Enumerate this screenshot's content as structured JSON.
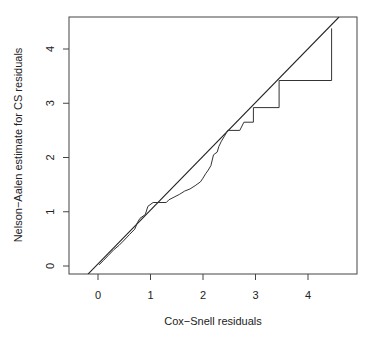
{
  "chart_data": {
    "type": "line",
    "title": "",
    "xlabel": "Cox−Snell residuals",
    "ylabel": "Nelson−Aalen estimate for CS residuals",
    "xlim": [
      -0.55,
      4.95
    ],
    "ylim": [
      -0.15,
      4.59
    ],
    "xticks": [
      0,
      1,
      2,
      3,
      4
    ],
    "yticks": [
      0,
      1,
      2,
      3,
      4
    ],
    "grid": false,
    "legend": null,
    "series": [
      {
        "name": "Nelson-Aalen cumulative hazard (step)",
        "style": "step",
        "points": [
          [
            0.02,
            0.02
          ],
          [
            0.1,
            0.1
          ],
          [
            0.2,
            0.2
          ],
          [
            0.3,
            0.3
          ],
          [
            0.4,
            0.38
          ],
          [
            0.5,
            0.48
          ],
          [
            0.6,
            0.58
          ],
          [
            0.7,
            0.68
          ],
          [
            0.75,
            0.8
          ],
          [
            0.8,
            0.88
          ],
          [
            0.9,
            0.95
          ],
          [
            0.95,
            1.1
          ],
          [
            1.05,
            1.17
          ],
          [
            1.3,
            1.17
          ],
          [
            1.35,
            1.22
          ],
          [
            1.45,
            1.27
          ],
          [
            1.55,
            1.32
          ],
          [
            1.65,
            1.38
          ],
          [
            1.75,
            1.42
          ],
          [
            1.85,
            1.48
          ],
          [
            1.95,
            1.55
          ],
          [
            2.0,
            1.62
          ],
          [
            2.05,
            1.7
          ],
          [
            2.1,
            1.77
          ],
          [
            2.15,
            1.85
          ],
          [
            2.2,
            2.05
          ],
          [
            2.27,
            2.1
          ],
          [
            2.3,
            2.2
          ],
          [
            2.35,
            2.3
          ],
          [
            2.4,
            2.38
          ],
          [
            2.47,
            2.5
          ],
          [
            2.7,
            2.5
          ],
          [
            2.78,
            2.65
          ],
          [
            2.96,
            2.65
          ],
          [
            2.96,
            2.92
          ],
          [
            3.45,
            2.92
          ],
          [
            3.45,
            3.42
          ],
          [
            4.45,
            3.42
          ],
          [
            4.45,
            4.38
          ]
        ]
      },
      {
        "name": "Reference line y = x",
        "style": "line",
        "points": [
          [
            -0.19,
            -0.15
          ],
          [
            4.59,
            4.59
          ]
        ]
      }
    ]
  },
  "axes": {
    "x_tick_labels": [
      "0",
      "1",
      "2",
      "3",
      "4"
    ],
    "y_tick_labels": [
      "0",
      "1",
      "2",
      "3",
      "4"
    ],
    "x_label": "Cox−Snell residuals",
    "y_label": "Nelson−Aalen estimate for CS residuals"
  },
  "colors": {
    "line": "#222222",
    "step": "#333333",
    "axis": "#444444",
    "text": "#222222",
    "background": "#ffffff"
  }
}
